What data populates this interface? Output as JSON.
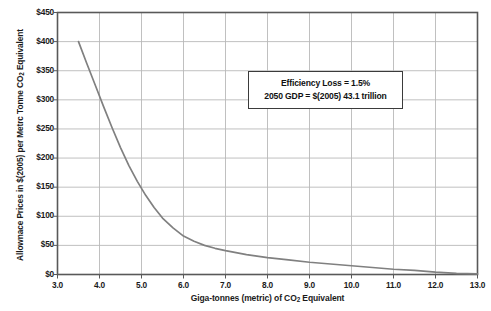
{
  "chart_data": {
    "type": "line",
    "title": "",
    "xlabel": "Giga-tonnes (metric) of CO2 Equivalent",
    "xlabel_parts": {
      "pre": "Giga-tonnes (metric) of CO",
      "sub": "2",
      "post": " Equivalent"
    },
    "ylabel": "Allownace Prices in $(2005) per Metrc Tonne CO2 Equivalent",
    "ylabel_parts": {
      "pre": "Allownace Prices in $(2005) per Metrc Tonne CO",
      "sub": "2",
      "post": " Equivalent"
    },
    "xlim": [
      3.0,
      13.0
    ],
    "ylim": [
      0,
      450
    ],
    "xticks": [
      "3.0",
      "4.0",
      "5.0",
      "6.0",
      "7.0",
      "8.0",
      "9.0",
      "10.0",
      "11.0",
      "12.0",
      "13.0"
    ],
    "xtick_values": [
      3.0,
      4.0,
      5.0,
      6.0,
      7.0,
      8.0,
      9.0,
      10.0,
      11.0,
      12.0,
      13.0
    ],
    "yticks": [
      "$0",
      "$50",
      "$100",
      "$150",
      "$200",
      "$250",
      "$300",
      "$350",
      "$400",
      "$450"
    ],
    "ytick_values": [
      0,
      50,
      100,
      150,
      200,
      250,
      300,
      350,
      400,
      450
    ],
    "grid": true,
    "legend": "none",
    "series": [
      {
        "name": "Allowance price curve",
        "color": "#808080",
        "x": [
          3.5,
          3.7,
          3.9,
          4.1,
          4.3,
          4.5,
          4.7,
          4.9,
          5.1,
          5.3,
          5.5,
          5.75,
          6.0,
          6.25,
          6.5,
          6.75,
          7.0,
          7.5,
          8.0,
          8.5,
          9.0,
          9.5,
          10.0,
          10.5,
          11.0,
          11.5,
          12.0,
          12.5,
          13.0
        ],
        "y": [
          400,
          362,
          325,
          288,
          252,
          218,
          187,
          160,
          136,
          115,
          97,
          80,
          66,
          57,
          50,
          45,
          41,
          34,
          29,
          25,
          21,
          18,
          15,
          12,
          9,
          7,
          4,
          2,
          1
        ]
      }
    ],
    "annotations": [
      {
        "name": "efficiency-note",
        "lines": [
          "Efficiency Loss  = 1.5%",
          "2050 GDP = $(2005) 43.1 trillion"
        ]
      }
    ],
    "colors": {
      "curve": "#808080",
      "grid": "#b9b9b9",
      "axis": "#595959",
      "text": "#111111",
      "background": "#ffffff"
    }
  }
}
